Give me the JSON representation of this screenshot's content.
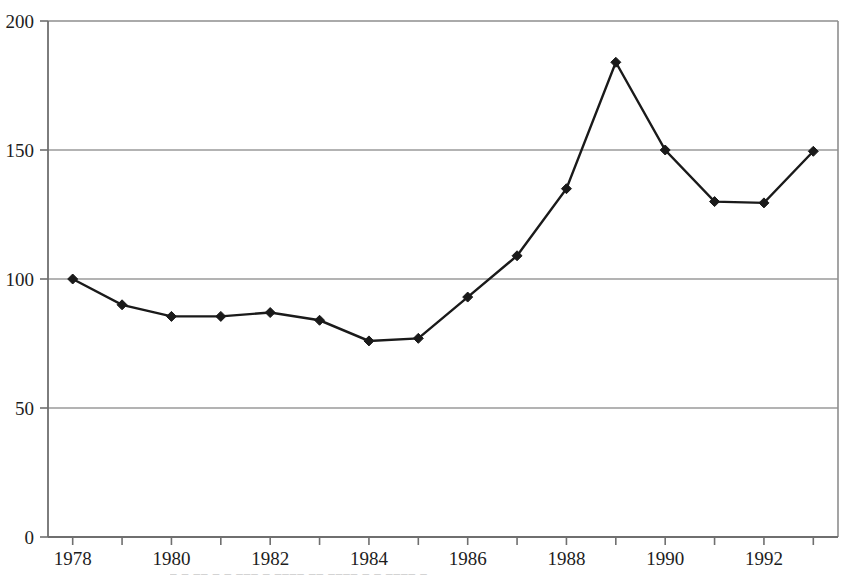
{
  "chart_data": {
    "type": "line",
    "title": "",
    "subtitle": "",
    "xlabel": "",
    "ylabel": "",
    "xlim": [
      1977.5,
      1993.5
    ],
    "ylim": [
      0,
      200
    ],
    "grid": true,
    "grid_axis": "y",
    "legend": false,
    "legend_position": "none",
    "marker": "diamond",
    "line_color": "#1a1a1a",
    "marker_color": "#1a1a1a",
    "grid_color": "#9a9a9a",
    "axis_color": "#6f6f6f",
    "background_color": "#ffffff",
    "x": [
      1978,
      1979,
      1980,
      1981,
      1982,
      1983,
      1984,
      1985,
      1986,
      1987,
      1988,
      1989,
      1990,
      1991,
      1992,
      1993
    ],
    "values": [
      100,
      90,
      85.5,
      85.5,
      87,
      84,
      76,
      77,
      93,
      109,
      135,
      184,
      150,
      130,
      129.5,
      149.5
    ],
    "series": [
      {
        "name": "series-1",
        "values": [
          100,
          90,
          85.5,
          85.5,
          87,
          84,
          76,
          77,
          93,
          109,
          135,
          184,
          150,
          130,
          129.5,
          149.5
        ]
      }
    ],
    "y_ticks": [
      0,
      50,
      100,
      150,
      200
    ],
    "y_tick_labels": [
      "0",
      "50",
      "100",
      "150",
      "200"
    ],
    "x_ticks": [
      1978,
      1979,
      1980,
      1981,
      1982,
      1983,
      1984,
      1985,
      1986,
      1987,
      1988,
      1989,
      1990,
      1991,
      1992,
      1993
    ],
    "x_tick_labels_shown": [
      "1978",
      "1980",
      "1982",
      "1984",
      "1986",
      "1988",
      "1990",
      "1992"
    ],
    "x_labeled_ticks": [
      1978,
      1980,
      1982,
      1984,
      1986,
      1988,
      1990,
      1992
    ]
  },
  "footer": {
    "cut_off_caption": "–  –    ––  – –  –––      –  –––– ––  –––– – –  ––––  –"
  }
}
